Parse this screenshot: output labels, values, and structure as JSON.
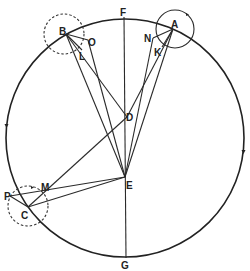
{
  "diagram": {
    "type": "geometric-astronomical-diagram",
    "labels": {
      "F": "F",
      "G": "G",
      "A": "A",
      "B": "B",
      "C": "C",
      "D": "D",
      "E": "E",
      "K": "K",
      "L": "L",
      "M": "M",
      "N": "N",
      "O": "O",
      "P": "P"
    },
    "colors": {
      "stroke": "#222222",
      "background": "#ffffff"
    },
    "elements": [
      {
        "id": "main-circle",
        "kind": "circle",
        "style": "solid",
        "direction_arrows": "counter-clockwise"
      },
      {
        "id": "epicycle-A",
        "kind": "circle",
        "style": "solid",
        "center": "A"
      },
      {
        "id": "epicycle-B",
        "kind": "circle",
        "style": "dashed",
        "center": "B"
      },
      {
        "id": "epicycle-C",
        "kind": "circle",
        "style": "dashed",
        "center": "C"
      },
      {
        "id": "line-FG",
        "kind": "line",
        "from": "F",
        "to": "G",
        "through": [
          "D",
          "E"
        ]
      }
    ]
  }
}
